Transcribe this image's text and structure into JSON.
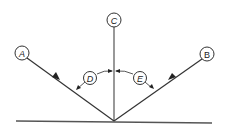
{
  "diagram": {
    "type": "law-of-reflection",
    "labels": {
      "incident_ray": "A",
      "reflected_ray": "B",
      "normal": "C",
      "angle_of_incidence": "D",
      "angle_of_reflection": "E"
    },
    "colors": {
      "line": "#333333",
      "background": "#ffffff"
    }
  }
}
